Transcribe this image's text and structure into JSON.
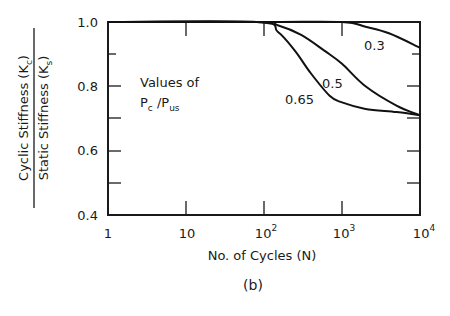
{
  "chart_data": {
    "type": "line",
    "title": "",
    "caption": "(b)",
    "xlabel": "No. of Cycles (N)",
    "ylabel_numerator": "Cyclic Stiffness (Kc)",
    "ylabel_denominator": "Static Stiffness (Ks)",
    "xscale": "log",
    "xlim": [
      1,
      10000
    ],
    "ylim": [
      0.4,
      1.0
    ],
    "x_ticks": [
      1,
      10,
      100,
      1000,
      10000
    ],
    "x_tick_labels": [
      "1",
      "10",
      "10^2",
      "10^3",
      "10^4"
    ],
    "y_ticks": [
      0.4,
      0.5,
      0.6,
      0.7,
      0.8,
      0.9,
      1.0
    ],
    "y_tick_labels": [
      "0.4",
      "",
      "0.6",
      "",
      "0.8",
      "",
      "1.0"
    ],
    "grid": false,
    "legend_title": "Values of Pc /Pus",
    "series": [
      {
        "name": "0.3",
        "x": [
          1,
          100,
          1000,
          2000,
          4000,
          10000
        ],
        "y": [
          1.0,
          1.0,
          1.0,
          0.985,
          0.965,
          0.92
        ]
      },
      {
        "name": "0.5",
        "x": [
          1,
          80,
          150,
          300,
          600,
          1000,
          2000,
          5000,
          10000
        ],
        "y": [
          1.0,
          1.0,
          0.99,
          0.96,
          0.91,
          0.87,
          0.8,
          0.74,
          0.71
        ]
      },
      {
        "name": "0.65",
        "x": [
          1,
          80,
          150,
          250,
          400,
          700,
          1000,
          2000,
          5000,
          10000
        ],
        "y": [
          1.0,
          1.0,
          0.97,
          0.91,
          0.84,
          0.77,
          0.75,
          0.73,
          0.72,
          0.71
        ]
      }
    ]
  },
  "labels": {
    "ylabel_num": "Cyclic  Stiffness  (K",
    "ylabel_num_sub": "c",
    "ylabel_den": "Static  Stiffness  (K",
    "ylabel_den_sub": "s",
    "close_paren": ")",
    "xlabel": "No.  of  Cycles  (N)",
    "caption": "(b)",
    "legend_line1": "Values  of",
    "legend_P1": "P",
    "legend_c": "c",
    "legend_slash": " /P",
    "legend_us": "us",
    "curve_03": "0.3",
    "curve_05": "0.5",
    "curve_065": "0.65",
    "y_10": "1.0",
    "y_08": "0.8",
    "y_06": "0.6",
    "y_04": "0.4",
    "x_1": "1",
    "x_10": "10",
    "x_base": "10",
    "x_e2": "2",
    "x_e3": "3",
    "x_e4": "4"
  }
}
